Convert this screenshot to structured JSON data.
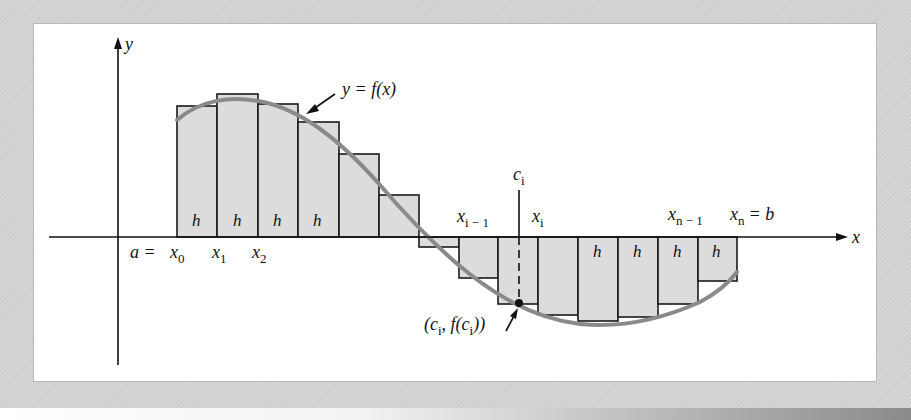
{
  "figure": {
    "type": "riemann-sum-diagram",
    "axes": {
      "x_label": "x",
      "y_label": "y"
    },
    "curve_label": "y = f(x)",
    "colors": {
      "background": "#d4d4d4",
      "panel": "#ffffff",
      "rect_fill": "#dcdcdc",
      "rect_stroke": "#1a1a1a",
      "curve": "#8a8a8a"
    },
    "partition_labels": {
      "a_eq": "a =",
      "x0": "x",
      "x0_sub": "0",
      "x1": "x",
      "x1_sub": "1",
      "x2": "x",
      "x2_sub": "2",
      "xi_minus_1": "x",
      "xi_minus_1_sub": "i − 1",
      "xi": "x",
      "xi_sub": "i",
      "xn_minus_1": "x",
      "xn_minus_1_sub": "n − 1",
      "xn": "x",
      "xn_sub": "n",
      "b_eq": "= b"
    },
    "ci_label": {
      "c": "c",
      "sub": "i"
    },
    "point_label": {
      "open": "(c",
      "sub1": "i",
      "mid": ", f(c",
      "sub2": "i",
      "close": "))"
    },
    "width_label": "h",
    "rectangles": [
      {
        "x": 177,
        "top": 106,
        "bottom": 237,
        "label": "h"
      },
      {
        "x": 217,
        "top": 94,
        "bottom": 237,
        "label": "h"
      },
      {
        "x": 258,
        "top": 104,
        "bottom": 237,
        "label": "h"
      },
      {
        "x": 298,
        "top": 122,
        "bottom": 237,
        "label": "h"
      },
      {
        "x": 339,
        "top": 154,
        "bottom": 237,
        "label": ""
      },
      {
        "x": 379,
        "top": 195,
        "bottom": 237,
        "label": ""
      },
      {
        "x": 419,
        "top": 237,
        "bottom": 247,
        "label": ""
      },
      {
        "x": 459,
        "top": 237,
        "bottom": 278,
        "label": ""
      },
      {
        "x": 498,
        "top": 237,
        "bottom": 304,
        "label": ""
      },
      {
        "x": 538,
        "top": 237,
        "bottom": 315,
        "label": ""
      },
      {
        "x": 578,
        "top": 237,
        "bottom": 321,
        "label": "h"
      },
      {
        "x": 618,
        "top": 237,
        "bottom": 317,
        "label": "h"
      },
      {
        "x": 658,
        "top": 237,
        "bottom": 304,
        "label": "h"
      },
      {
        "x": 698,
        "top": 237,
        "bottom": 281,
        "label": "h"
      }
    ]
  }
}
